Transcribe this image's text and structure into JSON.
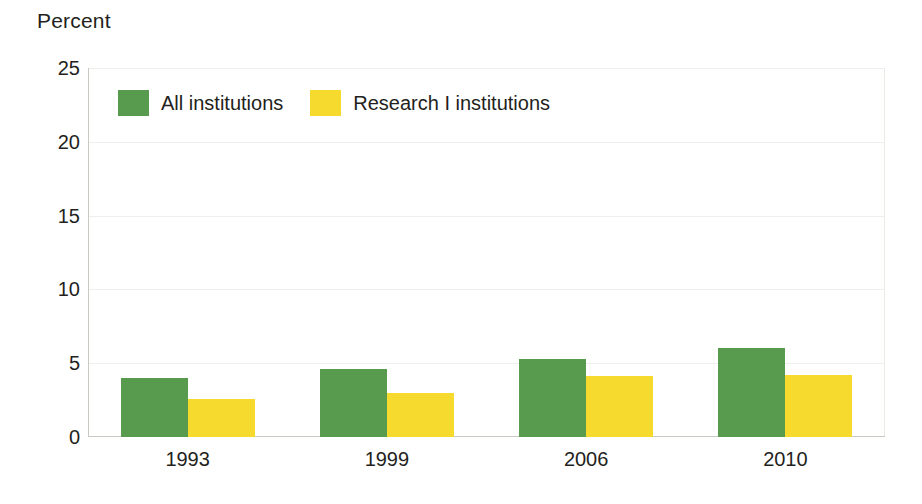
{
  "chart_data": {
    "type": "bar",
    "title": "",
    "subtitle": "",
    "xlabel": "",
    "ylabel": "Percent",
    "categories": [
      "1993",
      "1999",
      "2006",
      "2010"
    ],
    "series": [
      {
        "name": "All institutions",
        "color": "#589b4e",
        "values": [
          4.0,
          4.6,
          5.3,
          6.0
        ]
      },
      {
        "name": "Research I institutions",
        "color": "#f7da2e",
        "values": [
          2.6,
          3.0,
          4.1,
          4.2
        ]
      }
    ],
    "ylim": [
      0,
      25
    ],
    "yticks": [
      0,
      5,
      10,
      15,
      20,
      25
    ],
    "ytick_labels": [
      "0",
      "5",
      "10",
      "15",
      "20",
      "25"
    ],
    "grid": true,
    "grid_axis": "y",
    "legend_position": "top-left-inside",
    "annotations": []
  },
  "axes": {
    "y_title": "Percent"
  },
  "legend": {
    "items": [
      {
        "label": "All institutions",
        "color": "#589b4e",
        "swatch": "legend-swatch-green"
      },
      {
        "label": "Research I institutions",
        "color": "#f7da2e",
        "swatch": "legend-swatch-yellow"
      }
    ]
  },
  "colors": {
    "series_all_institutions": "#589b4e",
    "series_research_i": "#f7da2e",
    "axis": "#c9c9c4",
    "gridline": "#eeeeea",
    "text": "#231f20",
    "background": "#ffffff"
  }
}
